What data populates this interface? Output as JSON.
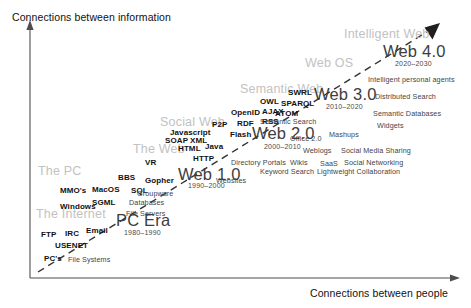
{
  "diagram": {
    "title_alt": "Web Evolution Timeline",
    "axes": {
      "y_label": "Connections between information",
      "x_label": "Connections between people"
    },
    "eras": [
      {
        "label": "The Internet",
        "x": 36,
        "y": 208
      },
      {
        "label": "The PC",
        "x": 38,
        "y": 165
      },
      {
        "label": "The Web",
        "x": 133,
        "y": 143
      },
      {
        "label": "Social Web",
        "x": 160,
        "y": 116
      },
      {
        "label": "Semantic Web",
        "x": 240,
        "y": 83
      },
      {
        "label": "Web OS",
        "x": 305,
        "y": 57
      },
      {
        "label": "Intelligent Web",
        "x": 344,
        "y": 28
      }
    ],
    "stages": [
      {
        "name": "PC Era",
        "years": "1980–1990",
        "nx": 116,
        "ny": 212,
        "yx": 124,
        "yy": 229
      },
      {
        "name": "Web 1.0",
        "years": "1990–2000",
        "nx": 178,
        "ny": 166,
        "yx": 188,
        "yy": 182
      },
      {
        "name": "Web 2.0",
        "years": "2000–2010",
        "nx": 252,
        "ny": 125,
        "yx": 264,
        "yy": 143
      },
      {
        "name": "Web 3.0",
        "years": "2010–2020",
        "nx": 314,
        "ny": 86,
        "yx": 326,
        "yy": 103
      },
      {
        "name": "Web 4.0",
        "years": "2020–2030",
        "nx": 383,
        "ny": 43,
        "yx": 395,
        "yy": 60
      }
    ],
    "tech_terms": [
      {
        "t": "PC's",
        "x": 44,
        "y": 255
      },
      {
        "t": "FTP",
        "x": 41,
        "y": 231
      },
      {
        "t": "IRC",
        "x": 65,
        "y": 230
      },
      {
        "t": "Email",
        "x": 86,
        "y": 227
      },
      {
        "t": "USENET",
        "x": 55,
        "y": 242
      },
      {
        "t": "Windows",
        "x": 60,
        "y": 203
      },
      {
        "t": "SGML",
        "x": 92,
        "y": 199
      },
      {
        "t": "MMO's",
        "x": 60,
        "y": 187
      },
      {
        "t": "MacOS",
        "x": 92,
        "y": 186
      },
      {
        "t": "SQL",
        "x": 131,
        "y": 187
      },
      {
        "t": "BBS",
        "x": 118,
        "y": 174
      },
      {
        "t": "Gopher",
        "x": 145,
        "y": 177
      },
      {
        "t": "VR",
        "x": 145,
        "y": 159
      },
      {
        "t": "HTTP",
        "x": 193,
        "y": 155
      },
      {
        "t": "HTML",
        "x": 178,
        "y": 145
      },
      {
        "t": "Java",
        "x": 205,
        "y": 143
      },
      {
        "t": "SOAP",
        "x": 165,
        "y": 137
      },
      {
        "t": "XML",
        "x": 190,
        "y": 137
      },
      {
        "t": "Javascript",
        "x": 170,
        "y": 129
      },
      {
        "t": "Flash",
        "x": 230,
        "y": 131
      },
      {
        "t": "P2P",
        "x": 212,
        "y": 121
      },
      {
        "t": "RDF",
        "x": 237,
        "y": 120
      },
      {
        "t": "RSS",
        "x": 262,
        "y": 118
      },
      {
        "t": "ATOM",
        "x": 275,
        "y": 110
      },
      {
        "t": "OpenID",
        "x": 231,
        "y": 109
      },
      {
        "t": "AJAX",
        "x": 262,
        "y": 108
      },
      {
        "t": "OWL",
        "x": 260,
        "y": 98
      },
      {
        "t": "SPARQL",
        "x": 281,
        "y": 100
      },
      {
        "t": "SWRL",
        "x": 288,
        "y": 89
      }
    ],
    "app_terms": [
      {
        "t": "File Systems",
        "x": 68,
        "y": 256
      },
      {
        "t": "File Servers",
        "x": 126,
        "y": 210
      },
      {
        "t": "Databases",
        "x": 129,
        "y": 199
      },
      {
        "t": "Groupware",
        "x": 137,
        "y": 190
      },
      {
        "t": "Websites",
        "x": 216,
        "y": 177
      },
      {
        "t": "Directory Portals",
        "x": 231,
        "y": 159
      },
      {
        "t": "Wikis",
        "x": 290,
        "y": 159
      },
      {
        "t": "SaaS",
        "x": 320,
        "y": 160
      },
      {
        "t": "Social Networking",
        "x": 344,
        "y": 159
      },
      {
        "t": "Keyword Search",
        "x": 260,
        "y": 168
      },
      {
        "t": "Lightweight Collaboration",
        "x": 317,
        "y": 168
      },
      {
        "t": "Weblogs",
        "x": 303,
        "y": 147
      },
      {
        "t": "Social Media Sharing",
        "x": 341,
        "y": 147
      },
      {
        "t": "Office 2.0",
        "x": 290,
        "y": 135
      },
      {
        "t": "Mashups",
        "x": 329,
        "y": 131
      },
      {
        "t": "Widgets",
        "x": 377,
        "y": 122
      },
      {
        "t": "Semantic Search",
        "x": 260,
        "y": 118
      },
      {
        "t": "Semantic Databases",
        "x": 373,
        "y": 110
      },
      {
        "t": "Distributed Search",
        "x": 375,
        "y": 93
      },
      {
        "t": "Intelligent personal agents",
        "x": 368,
        "y": 76
      }
    ],
    "colors": {
      "axis": "#4d4d4d",
      "trend_line": "#333333",
      "ghost_text": "#c2c2c2",
      "stage_text": "#3d3d3d",
      "tech_text": "#111111",
      "app_text": "#444444",
      "background": "#ffffff"
    }
  }
}
